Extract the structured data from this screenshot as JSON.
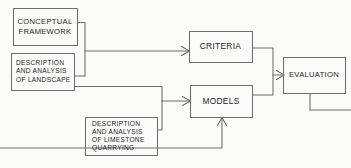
{
  "diagram": {
    "style": {
      "background": "#fbfbfa",
      "stroke": "#6d6d6d",
      "text": "#1d1d1f"
    },
    "nodes": [
      {
        "id": "conceptual-framework",
        "label": "CONCEPTUAL\nFRAMEWORK",
        "lines": [
          "CONCEPTUAL",
          "FRAMEWORK"
        ],
        "x": 13,
        "y": 8,
        "w": 64,
        "h": 37,
        "size": "sz-md"
      },
      {
        "id": "description-landscape",
        "label": "DESCRIPTION\nAND ANALYSIS\nOF LANDSCAPE",
        "lines": [
          "DESCRIPTION",
          "AND ANALYSIS",
          "OF LANDSCAPE"
        ],
        "x": 11,
        "y": 53,
        "w": 63,
        "h": 37,
        "size": "sz-sm"
      },
      {
        "id": "description-limestone",
        "label": "DESCRIPTION\nAND ANALYSIS\nOF LIMESTONE\nQUARRYING",
        "lines": [
          "DESCRIPTION",
          "AND ANALYSIS",
          "OF LIMESTONE",
          "QUARRYING"
        ],
        "x": 85,
        "y": 117,
        "w": 72,
        "h": 38,
        "size": "sz-sm"
      },
      {
        "id": "criteria",
        "label": "CRITERIA",
        "lines": [
          "CRITERIA"
        ],
        "x": 189,
        "y": 31,
        "w": 63,
        "h": 31,
        "size": "sz-lg"
      },
      {
        "id": "models",
        "label": "MODELS",
        "lines": [
          "MODELS"
        ],
        "x": 190,
        "y": 85,
        "w": 62,
        "h": 32,
        "size": "sz-lg"
      },
      {
        "id": "evaluation",
        "label": "EVALUATION",
        "lines": [
          "EVALUATION"
        ],
        "x": 283,
        "y": 57,
        "w": 62,
        "h": 36,
        "size": "sz-md"
      }
    ],
    "edges": [
      {
        "id": "framework-to-junction",
        "from": "conceptual-framework",
        "to": "criteria",
        "arrow": true
      },
      {
        "id": "landscape-to-junction",
        "from": "description-landscape",
        "to": "criteria",
        "arrow": true
      },
      {
        "id": "landscape-to-models",
        "from": "description-landscape",
        "to": "models",
        "arrow": true
      },
      {
        "id": "limestone-to-models-side",
        "from": "description-limestone",
        "to": "models",
        "arrow": true
      },
      {
        "id": "limestone-to-models-bottom",
        "from": "description-limestone",
        "to": "models",
        "arrow": true
      },
      {
        "id": "criteria-to-evaluation",
        "from": "criteria",
        "to": "evaluation",
        "arrow": true
      },
      {
        "id": "models-to-evaluation",
        "from": "models",
        "to": "evaluation",
        "arrow": true
      }
    ]
  }
}
